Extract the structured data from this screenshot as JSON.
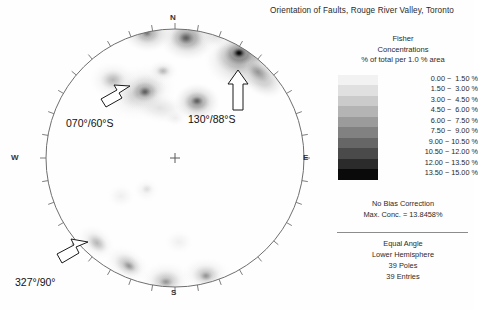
{
  "title": "Orientation of Faults, Rouge River Valley, Toronto",
  "stereonet": {
    "directions": {
      "north": "N",
      "south": "S",
      "west": "W",
      "east": "E"
    },
    "annotations": [
      {
        "label": "070°/60°S"
      },
      {
        "label": "130°/88°S"
      },
      {
        "label": "327°/90°"
      }
    ]
  },
  "legend": {
    "line1": "Fisher",
    "line2": "Concentrations",
    "line3": "% of total per 1.0 % area",
    "bands": [
      {
        "range": "0.00 ~  1.50 %",
        "color": "#f2f2f2"
      },
      {
        "range": "1.50 ~  3.00 %",
        "color": "#e0e0e0"
      },
      {
        "range": "3.00 ~  4.50 %",
        "color": "#cbcbcb"
      },
      {
        "range": "4.50 ~  6.00 %",
        "color": "#b4b4b4"
      },
      {
        "range": "6.00 ~  7.50 %",
        "color": "#9b9b9b"
      },
      {
        "range": "7.50 ~  9.00 %",
        "color": "#818181"
      },
      {
        "range": "9.00 ~ 10.50 %",
        "color": "#666666"
      },
      {
        "range": "10.50 ~ 12.00 %",
        "color": "#4a4a4a"
      },
      {
        "range": "12.00 ~ 13.50 %",
        "color": "#2b2b2b"
      },
      {
        "range": "13.50 ~ 15.00 %",
        "color": "#0a0a0a"
      }
    ]
  },
  "notes": {
    "bias": "No Bias Correction",
    "max_conc": "Max. Conc. = 13.8458%"
  },
  "footer": {
    "projection": "Equal Angle",
    "hemisphere": "Lower Hemisphere",
    "poles": "39 Poles",
    "entries": "39 Entries"
  },
  "chart_data": {
    "type": "contour",
    "title": "Orientation of Faults, Rouge River Valley, Toronto",
    "projection": "Equal Angle",
    "hemisphere": "Lower Hemisphere",
    "n_poles": 39,
    "n_entries": 39,
    "method": "Fisher Concentrations",
    "units": "% of total per 1.0 % area",
    "bias_correction": false,
    "max_concentration": 13.8458,
    "contour_levels": [
      0.0,
      1.5,
      3.0,
      4.5,
      6.0,
      7.5,
      9.0,
      10.5,
      12.0,
      13.5,
      15.0
    ],
    "azimuth_tick_interval_deg": 10,
    "center_marker": "cross",
    "annotated_planes": [
      {
        "label": "070°/60°S",
        "strike": 70,
        "dip": 60,
        "dip_direction": "S"
      },
      {
        "label": "130°/88°S",
        "strike": 130,
        "dip": 88,
        "dip_direction": "S"
      },
      {
        "label": "327°/90°",
        "strike": 327,
        "dip": 90,
        "dip_direction": ""
      }
    ],
    "concentration_maxima": [
      {
        "cx": 240,
        "cy": 55,
        "peak_percent": 13.8,
        "r": 22
      },
      {
        "cx": 185,
        "cy": 40,
        "peak_percent": 8.5,
        "r": 24
      },
      {
        "cx": 145,
        "cy": 32,
        "peak_percent": 6.0,
        "r": 20
      },
      {
        "cx": 144,
        "cy": 93,
        "peak_percent": 8.0,
        "r": 22
      },
      {
        "cx": 196,
        "cy": 102,
        "peak_percent": 7.0,
        "r": 18
      },
      {
        "cx": 113,
        "cy": 82,
        "peak_percent": 4.5,
        "r": 20
      },
      {
        "cx": 163,
        "cy": 72,
        "peak_percent": 4.5,
        "r": 16
      },
      {
        "cx": 98,
        "cy": 243,
        "peak_percent": 5.0,
        "r": 20
      },
      {
        "cx": 128,
        "cy": 263,
        "peak_percent": 7.0,
        "r": 18
      },
      {
        "cx": 165,
        "cy": 278,
        "peak_percent": 5.5,
        "r": 22
      },
      {
        "cx": 205,
        "cy": 272,
        "peak_percent": 4.5,
        "r": 20
      },
      {
        "cx": 179,
        "cy": 243,
        "peak_percent": 2.0,
        "r": 14
      },
      {
        "cx": 121,
        "cy": 195,
        "peak_percent": 1.6,
        "r": 13
      },
      {
        "cx": 145,
        "cy": 190,
        "peak_percent": 2.2,
        "r": 12
      },
      {
        "cx": 175,
        "cy": 118,
        "peak_percent": 2.0,
        "r": 11
      }
    ]
  }
}
